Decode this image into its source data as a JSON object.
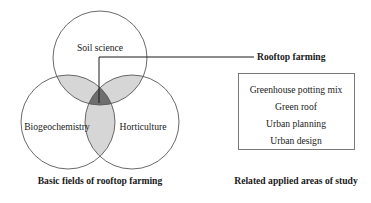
{
  "figure": {
    "venn": {
      "circles": [
        {
          "id": "soil-science",
          "label": "Soil science"
        },
        {
          "id": "biogeochemistry",
          "label": "Biogeochemistry"
        },
        {
          "id": "horticulture",
          "label": "Horticulture"
        }
      ],
      "caption": "Basic fields of rooftop farming",
      "callout_label": "Rooftop farming"
    },
    "related": {
      "items": [
        "Greenhouse potting mix",
        "Green roof",
        "Urban planning",
        "Urban design"
      ],
      "caption": "Related applied areas of study"
    },
    "colors": {
      "background": "#ffffff",
      "circle_stroke": "#595959",
      "pairwise_overlap_fill": "#d6d6d6",
      "triple_overlap_fill": "#6e6e6e",
      "leader_line": "#1a1a1a",
      "box_stroke": "#6b6b6b",
      "text": "#1a1a1a"
    }
  }
}
